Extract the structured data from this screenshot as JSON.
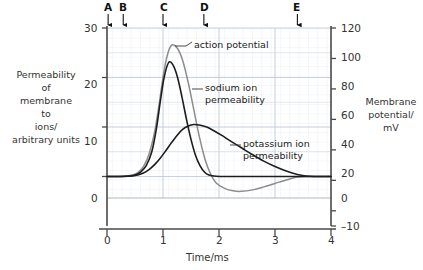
{
  "chart_data": {
    "type": "line",
    "title": "",
    "xlabel": "Time/ms",
    "ylabel_left": "Permeability of membrane to ions/ arbitrary units",
    "ylabel_right": "Membrane potential/ mV",
    "xlim": [
      0,
      4
    ],
    "ylim_left": [
      -10,
      30
    ],
    "ylim_right": [
      -10,
      120
    ],
    "grid": true,
    "legend_position": "inline-annotations",
    "xticks": [
      "0",
      "1",
      "2",
      "3",
      "4"
    ],
    "xtick_values": [
      0,
      1,
      2,
      3,
      4
    ],
    "yticks_left": [
      "0",
      "10",
      "20",
      "30"
    ],
    "ytick_values_left": [
      0,
      10,
      20,
      30
    ],
    "yticks_right": [
      "-10",
      "0",
      "20",
      "40",
      "60",
      "80",
      "100",
      "120"
    ],
    "ytick_values_right": [
      -10,
      0,
      20,
      40,
      60,
      80,
      100,
      120
    ],
    "series": [
      {
        "name": "action potential",
        "color": "#8c8c8c",
        "axis": "right",
        "peak_x": 1.15,
        "peak_y": 26.5,
        "points": [
          [
            0.0,
            0.0
          ],
          [
            0.2,
            0.0
          ],
          [
            0.35,
            0.1
          ],
          [
            0.45,
            0.3
          ],
          [
            0.55,
            0.8
          ],
          [
            0.65,
            2.0
          ],
          [
            0.75,
            4.5
          ],
          [
            0.85,
            9.0
          ],
          [
            0.93,
            14.5
          ],
          [
            1.0,
            20.0
          ],
          [
            1.07,
            24.2
          ],
          [
            1.15,
            26.5
          ],
          [
            1.25,
            26.0
          ],
          [
            1.35,
            23.5
          ],
          [
            1.45,
            19.0
          ],
          [
            1.55,
            13.5
          ],
          [
            1.65,
            8.0
          ],
          [
            1.75,
            3.5
          ],
          [
            1.85,
            0.5
          ],
          [
            1.95,
            -1.3
          ],
          [
            2.1,
            -2.4
          ],
          [
            2.25,
            -2.9
          ],
          [
            2.4,
            -3.0
          ],
          [
            2.6,
            -2.7
          ],
          [
            2.8,
            -2.1
          ],
          [
            3.0,
            -1.4
          ],
          [
            3.2,
            -0.7
          ],
          [
            3.4,
            -0.1
          ],
          [
            3.6,
            0.0
          ],
          [
            4.0,
            0.0
          ]
        ]
      },
      {
        "name": "sodium ion permeability",
        "color": "#1d1d1d",
        "axis": "left",
        "peak_x": 1.1,
        "peak_y": 23.0,
        "points": [
          [
            0.0,
            0.0
          ],
          [
            0.25,
            0.0
          ],
          [
            0.4,
            0.1
          ],
          [
            0.5,
            0.3
          ],
          [
            0.6,
            0.9
          ],
          [
            0.7,
            2.2
          ],
          [
            0.8,
            5.0
          ],
          [
            0.88,
            9.5
          ],
          [
            0.95,
            15.0
          ],
          [
            1.02,
            20.0
          ],
          [
            1.1,
            23.0
          ],
          [
            1.18,
            22.5
          ],
          [
            1.26,
            20.0
          ],
          [
            1.34,
            16.0
          ],
          [
            1.42,
            11.5
          ],
          [
            1.5,
            7.5
          ],
          [
            1.58,
            4.3
          ],
          [
            1.66,
            2.2
          ],
          [
            1.74,
            0.9
          ],
          [
            1.82,
            0.3
          ],
          [
            1.95,
            0.05
          ],
          [
            2.2,
            0.0
          ],
          [
            3.0,
            0.0
          ],
          [
            4.0,
            0.0
          ]
        ]
      },
      {
        "name": "potassium ion permeability",
        "color": "#1d1d1d",
        "axis": "left",
        "peak_x": 1.55,
        "peak_y": 10.5,
        "points": [
          [
            0.0,
            0.0
          ],
          [
            0.3,
            0.0
          ],
          [
            0.45,
            0.1
          ],
          [
            0.55,
            0.3
          ],
          [
            0.65,
            0.7
          ],
          [
            0.75,
            1.4
          ],
          [
            0.85,
            2.4
          ],
          [
            0.95,
            3.7
          ],
          [
            1.05,
            5.2
          ],
          [
            1.15,
            6.8
          ],
          [
            1.25,
            8.3
          ],
          [
            1.35,
            9.5
          ],
          [
            1.45,
            10.2
          ],
          [
            1.55,
            10.5
          ],
          [
            1.65,
            10.4
          ],
          [
            1.78,
            10.0
          ],
          [
            1.9,
            9.3
          ],
          [
            2.05,
            8.3
          ],
          [
            2.2,
            7.2
          ],
          [
            2.4,
            5.8
          ],
          [
            2.6,
            4.4
          ],
          [
            2.8,
            3.1
          ],
          [
            3.0,
            2.0
          ],
          [
            3.2,
            1.1
          ],
          [
            3.4,
            0.4
          ],
          [
            3.55,
            0.1
          ],
          [
            3.7,
            0.0
          ],
          [
            4.0,
            0.0
          ]
        ]
      }
    ],
    "annotations": [
      {
        "label": "action potential",
        "series": "action potential"
      },
      {
        "label": "sodium ion\npermeability",
        "series": "sodium ion permeability"
      },
      {
        "label": "potassium ion\npermeability",
        "series": "potassium ion permeability"
      }
    ],
    "markers": [
      {
        "letter": "A",
        "x": 0.02
      },
      {
        "letter": "B",
        "x": 0.29
      },
      {
        "letter": "C",
        "x": 1.0
      },
      {
        "letter": "D",
        "x": 1.73
      },
      {
        "letter": "E",
        "x": 3.4
      }
    ]
  },
  "labels": {
    "left_axis_lines": [
      "Permeability",
      "of",
      "membrane",
      "to",
      "ions/",
      "arbitrary units"
    ],
    "right_axis_lines": [
      "Membrane",
      "potential/",
      "mV"
    ],
    "x_axis_title": "Time/ms",
    "annotation_action_potential": "action potential",
    "annotation_sodium_line1": "sodium ion",
    "annotation_sodium_line2": "permeability",
    "annotation_potassium_line1": "potassium ion",
    "annotation_potassium_line2": "permeability",
    "marker_a": "A",
    "marker_b": "B",
    "marker_c": "C",
    "marker_d": "D",
    "marker_e": "E",
    "xtick_0": "0",
    "xtick_1": "1",
    "xtick_2": "2",
    "xtick_3": "3",
    "xtick_4": "4",
    "ytick_l_0": "0",
    "ytick_l_10": "10",
    "ytick_l_20": "20",
    "ytick_l_30": "30",
    "ytick_r_m10": "–10",
    "ytick_r_0": "0",
    "ytick_r_20": "20",
    "ytick_r_40": "40",
    "ytick_r_60": "60",
    "ytick_r_80": "80",
    "ytick_r_100": "100",
    "ytick_r_120": "120"
  },
  "colors": {
    "action_potential": "#8c8c8c",
    "ion_curves": "#1d1d1d",
    "grid_minor": "#dfe6ef",
    "grid_major": "#b9c4d2",
    "axis": "#4a4a4a"
  }
}
